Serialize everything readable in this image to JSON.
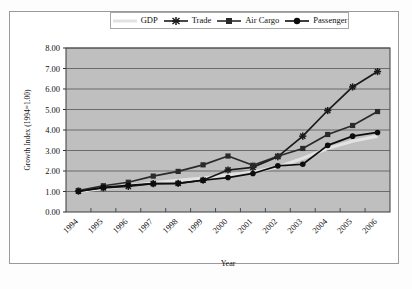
{
  "chart_data": {
    "type": "line",
    "title": "",
    "xlabel": "Year",
    "ylabel": "Growth Index (1994=1.00)",
    "categories": [
      "1994",
      "1995",
      "1996",
      "1997",
      "1998",
      "1999",
      "2000",
      "2001",
      "2002",
      "2003",
      "2004",
      "2005",
      "2006"
    ],
    "ylim": [
      0,
      8
    ],
    "ytick_labels": [
      "0.00",
      "1.00",
      "2.00",
      "3.00",
      "4.00",
      "5.00",
      "6.00",
      "7.00",
      "8.00"
    ],
    "ytick_values": [
      0,
      1,
      2,
      3,
      4,
      5,
      6,
      7,
      8
    ],
    "grid": true,
    "legend_position": "top",
    "plot_background": "#bfbfbf",
    "series": [
      {
        "name": "GDP",
        "marker": "none",
        "color": "#e2e2e2",
        "values": [
          1.0,
          1.15,
          1.28,
          1.42,
          1.55,
          1.66,
          1.8,
          1.95,
          2.2,
          2.62,
          3.1,
          3.45,
          3.7
        ]
      },
      {
        "name": "Trade",
        "marker": "star",
        "color": "#1a1a1a",
        "values": [
          1.02,
          1.18,
          1.25,
          1.38,
          1.4,
          1.55,
          2.05,
          2.18,
          2.7,
          3.7,
          4.95,
          6.1,
          6.85
        ]
      },
      {
        "name": "Air Cargo",
        "marker": "square",
        "color": "#2a2a2a",
        "values": [
          1.05,
          1.28,
          1.45,
          1.75,
          1.98,
          2.3,
          2.73,
          2.28,
          2.72,
          3.1,
          3.78,
          4.22,
          4.9
        ]
      },
      {
        "name": "Passenger",
        "marker": "circle",
        "color": "#0d0d0d",
        "values": [
          1.0,
          1.2,
          1.3,
          1.38,
          1.4,
          1.55,
          1.68,
          1.88,
          2.25,
          2.33,
          3.25,
          3.7,
          3.88
        ]
      }
    ]
  },
  "legend": {
    "items": [
      {
        "label": "GDP",
        "key": "line-plain"
      },
      {
        "label": "Trade",
        "key": "line-star"
      },
      {
        "label": "Air Cargo",
        "key": "line-square"
      },
      {
        "label": "Passenger",
        "key": "line-circle"
      }
    ]
  }
}
